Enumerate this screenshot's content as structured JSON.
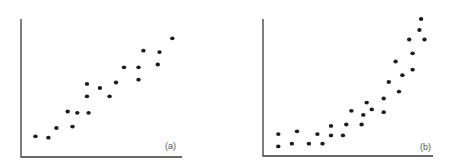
{
  "figure": {
    "panels": [
      {
        "id": "a",
        "label": "(a)"
      },
      {
        "id": "b",
        "label": "(b)"
      }
    ]
  },
  "colors": {
    "axis": "#3a3a3a",
    "points": "#1c1c1c",
    "label": "#555555"
  },
  "chart_data": [
    {
      "type": "scatter",
      "title": "",
      "panel_label": "(a)",
      "xlabel": "",
      "ylabel": "",
      "grid": false,
      "legend": null,
      "description": "Approximately linear positive relationship",
      "x": [
        0.09,
        0.17,
        0.22,
        0.32,
        0.29,
        0.35,
        0.42,
        0.41,
        0.41,
        0.49,
        0.55,
        0.59,
        0.64,
        0.73,
        0.73,
        0.76,
        0.86,
        0.85,
        0.94
      ],
      "y": [
        0.15,
        0.14,
        0.21,
        0.22,
        0.33,
        0.32,
        0.32,
        0.44,
        0.53,
        0.5,
        0.44,
        0.54,
        0.65,
        0.65,
        0.56,
        0.77,
        0.76,
        0.67,
        0.86
      ],
      "xlim": [
        0,
        1
      ],
      "ylim": [
        0,
        1
      ]
    },
    {
      "type": "scatter",
      "title": "",
      "panel_label": "(b)",
      "xlabel": "",
      "ylabel": "",
      "grid": false,
      "legend": null,
      "description": "Curvilinear (exponential-like) positive relationship",
      "x": [
        0.09,
        0.09,
        0.17,
        0.2,
        0.27,
        0.32,
        0.35,
        0.4,
        0.4,
        0.47,
        0.49,
        0.52,
        0.58,
        0.59,
        0.61,
        0.64,
        0.71,
        0.71,
        0.74,
        0.8,
        0.78,
        0.82,
        0.88,
        0.88,
        0.86,
        0.92,
        0.95,
        0.93
      ],
      "y": [
        0.07,
        0.16,
        0.09,
        0.18,
        0.09,
        0.16,
        0.09,
        0.15,
        0.22,
        0.15,
        0.23,
        0.33,
        0.23,
        0.3,
        0.39,
        0.34,
        0.32,
        0.42,
        0.54,
        0.47,
        0.69,
        0.59,
        0.63,
        0.75,
        0.85,
        0.92,
        0.85,
        1.0
      ],
      "xlim": [
        0,
        1
      ],
      "ylim": [
        0,
        1
      ]
    }
  ]
}
